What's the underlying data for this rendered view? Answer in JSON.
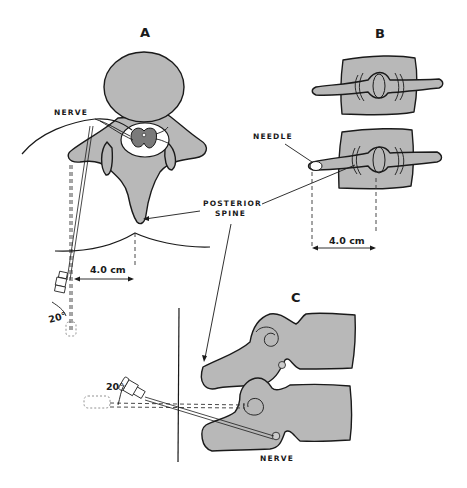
{
  "figure": {
    "panels": [
      {
        "id": "A",
        "label": "A",
        "view": "axial vertebra with needle approach"
      },
      {
        "id": "B",
        "label": "B",
        "view": "posterior view of vertebrae with needle"
      },
      {
        "id": "C",
        "label": "C",
        "view": "lateral view of vertebrae with needle"
      }
    ],
    "labels": {
      "nerve_a": "NERVE",
      "needle_b": "NEEDLE",
      "posterior_spine_line1": "POSTERIOR",
      "posterior_spine_line2": "SPINE",
      "nerve_c": "NERVE"
    },
    "measurements": {
      "distance_a": "4.0 cm",
      "distance_b": "4.0 cm",
      "angle_a": "20°",
      "angle_c": "20°"
    },
    "colors": {
      "bone_fill": "#b8b8b8",
      "cord_fill": "#7a7a7a",
      "line": "#1a1a1a",
      "background": "#ffffff"
    }
  }
}
